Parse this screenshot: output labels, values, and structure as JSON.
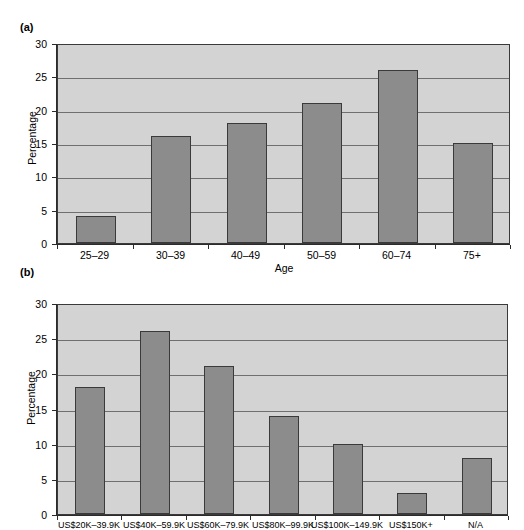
{
  "figures": [
    {
      "id": "a",
      "panel_label": "(a)",
      "ylabel": "Percentage",
      "xlabel": "Age"
    },
    {
      "id": "b",
      "panel_label": "(b)",
      "ylabel": "Percentage",
      "xlabel": ""
    }
  ],
  "colors": {
    "bar_fill": "#8c8c8c",
    "bar_stroke": "#3a3a3a",
    "plot_background": "#d3d3d3",
    "gridline": "#6f6f6f",
    "axis": "#2b2b2b",
    "page_background": "#ffffff",
    "text": "#000000"
  },
  "chart_data": [
    {
      "type": "bar",
      "panel": "(a)",
      "title": "",
      "xlabel": "Age",
      "ylabel": "Percentage",
      "categories": [
        "25–29",
        "30–39",
        "40–49",
        "50–59",
        "60–74",
        "75+"
      ],
      "values": [
        4,
        16,
        18,
        21,
        26,
        15
      ],
      "ylim": [
        0,
        30
      ],
      "yticks": [
        0,
        5,
        10,
        15,
        20,
        25,
        30
      ],
      "ytick_labels": [
        "0",
        "5",
        "10",
        "15",
        "20",
        "25",
        "30"
      ],
      "grid": true,
      "legend": null
    },
    {
      "type": "bar",
      "panel": "(b)",
      "title": "",
      "xlabel": "",
      "ylabel": "Percentage",
      "categories": [
        "US$20K–39.9K",
        "US$40K–59.9K",
        "US$60K–79.9K",
        "US$80K–99.9K",
        "US$100K–149.9K",
        "US$150K+",
        "N/A"
      ],
      "values": [
        18,
        26,
        21,
        14,
        10,
        3,
        8
      ],
      "ylim": [
        0,
        30
      ],
      "yticks": [
        0,
        5,
        10,
        15,
        20,
        25,
        30
      ],
      "ytick_labels": [
        "0",
        "5",
        "10",
        "15",
        "20",
        "25",
        "30"
      ],
      "grid": true,
      "legend": null
    }
  ]
}
